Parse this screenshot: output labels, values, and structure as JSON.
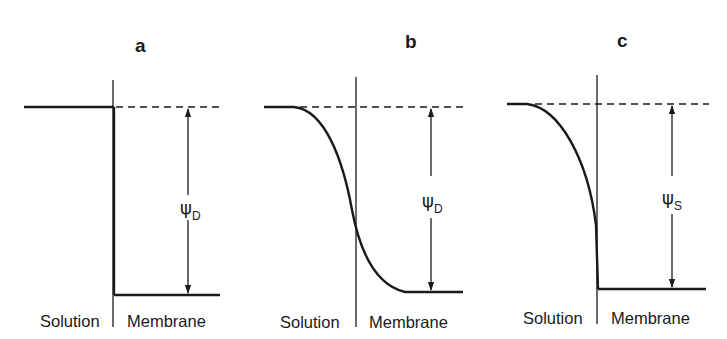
{
  "figure": {
    "panels": [
      {
        "label": "a",
        "profile": "step",
        "potential_symbol": "ψ",
        "potential_subscript": "D",
        "left_region": "Solution",
        "right_region": "Membrane"
      },
      {
        "label": "b",
        "profile": "sigmoid",
        "potential_symbol": "ψ",
        "potential_subscript": "D",
        "left_region": "Solution",
        "right_region": "Membrane"
      },
      {
        "label": "c",
        "profile": "solution-side decay",
        "potential_symbol": "ψ",
        "potential_subscript": "S",
        "left_region": "Solution",
        "right_region": "Membrane"
      }
    ],
    "colors": {
      "ink": "#1a1a1a",
      "background": "#ffffff"
    }
  }
}
